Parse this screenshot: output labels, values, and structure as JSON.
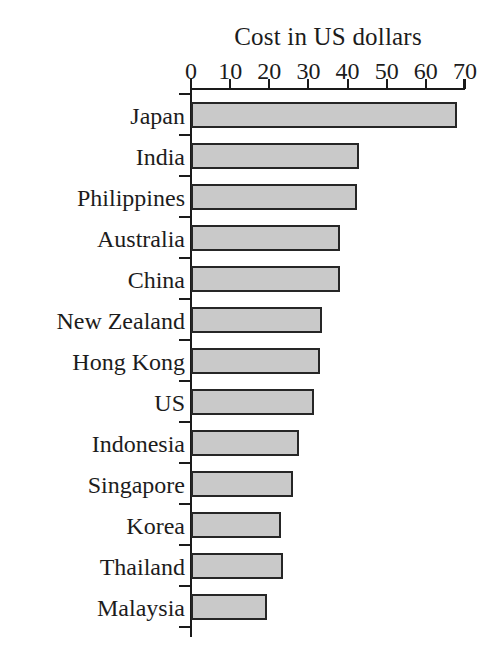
{
  "chart_data": {
    "type": "bar",
    "orientation": "horizontal",
    "title": "Cost in US dollars",
    "xlabel": "",
    "ylabel": "",
    "xlim": [
      0,
      70
    ],
    "grid": false,
    "legend": false,
    "bar_color": "#c9c9c9",
    "bar_border_color": "#262626",
    "axis_color": "#1a1a1a",
    "background_color": "#ffffff",
    "xticks": [
      0,
      10,
      20,
      30,
      40,
      50,
      60,
      70
    ],
    "xtick_labels": [
      "0",
      "10",
      "20",
      "30",
      "40",
      "50",
      "60",
      "70"
    ],
    "categories": [
      "Japan",
      "India",
      "Philippines",
      "Australia",
      "China",
      "New Zealand",
      "Hong Kong",
      "US",
      "Indonesia",
      "Singapore",
      "Korea",
      "Thailand",
      "Malaysia"
    ],
    "values": [
      68,
      43,
      42.5,
      38,
      38,
      33.5,
      33,
      31.5,
      27.5,
      26,
      23,
      23.5,
      19.5
    ]
  }
}
